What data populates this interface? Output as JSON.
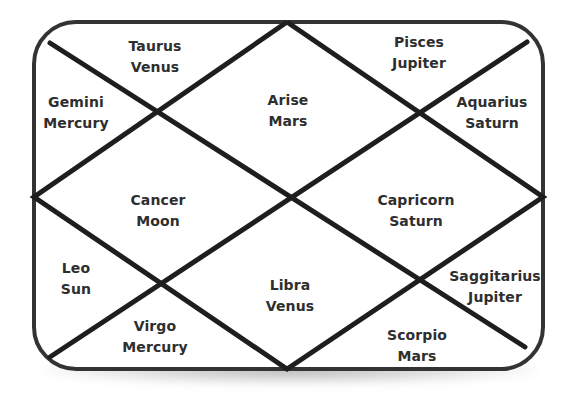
{
  "chart_type": "North Indian style birth chart (diamond layout)",
  "colors": {
    "border": "#333333",
    "lines": "#1e1e1e",
    "text": "#2e2e2e",
    "background": "#ffffff"
  },
  "houses": [
    {
      "position": "top-left-triangle",
      "sign": "Taurus",
      "planet": "Venus",
      "x": 155,
      "y": 57
    },
    {
      "position": "top-center-diamond",
      "sign": "Arise",
      "planet": "Mars",
      "x": 288,
      "y": 111
    },
    {
      "position": "top-right-triangle",
      "sign": "Pisces",
      "planet": "Jupiter",
      "x": 419,
      "y": 53
    },
    {
      "position": "left-upper-triangle",
      "sign": "Gemini",
      "planet": "Mercury",
      "x": 76,
      "y": 113
    },
    {
      "position": "right-upper-triangle",
      "sign": "Aquarius",
      "planet": "Saturn",
      "x": 492,
      "y": 113
    },
    {
      "position": "left-center-diamond",
      "sign": "Cancer",
      "planet": "Moon",
      "x": 158,
      "y": 211
    },
    {
      "position": "right-center-diamond",
      "sign": "Capricorn",
      "planet": "Saturn",
      "x": 416,
      "y": 211
    },
    {
      "position": "left-lower-triangle",
      "sign": "Leo",
      "planet": "Sun",
      "x": 76,
      "y": 279
    },
    {
      "position": "bottom-center-diamond",
      "sign": "Libra",
      "planet": "Venus",
      "x": 290,
      "y": 296
    },
    {
      "position": "right-lower-triangle",
      "sign": "Saggitarius",
      "planet": "Jupiter",
      "x": 495,
      "y": 287
    },
    {
      "position": "bottom-left-triangle",
      "sign": "Virgo",
      "planet": "Mercury",
      "x": 155,
      "y": 337
    },
    {
      "position": "bottom-right-triangle",
      "sign": "Scorpio",
      "planet": "Mars",
      "x": 417,
      "y": 346
    }
  ]
}
